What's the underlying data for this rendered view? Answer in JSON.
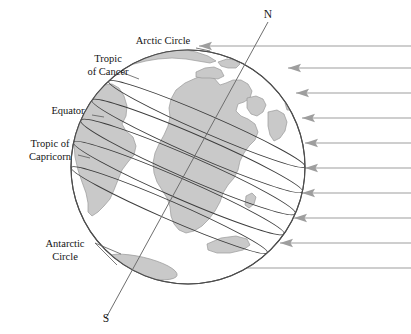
{
  "figure": {
    "background_color": "#ffffff",
    "land_color": "#c9c9c9",
    "land_stroke": "#9a9a9a",
    "outline_color": "#4d4d4d",
    "latitude_line_color": "#3c3c3c",
    "axis_color": "#6e6e6e",
    "ray_color": "#9e9e9e",
    "text_color": "#141414"
  },
  "globe": {
    "center_x": 188,
    "center_y": 167,
    "radius": 117,
    "axis_tilt_degrees": 23.5
  },
  "axis": {
    "north_label": "N",
    "south_label": "S",
    "north_x": 268,
    "north_y": 22,
    "south_x": 106,
    "south_y": 318
  },
  "latitude_labels": [
    {
      "id": "arctic-circle",
      "text": "Arctic Circle",
      "line1": "Arctic Circle",
      "line2": "",
      "x": 163,
      "y": 44,
      "anchor": "middle"
    },
    {
      "id": "tropic-of-cancer",
      "text": "Tropic of Cancer",
      "line1": "Tropic",
      "line2": "of Cancer",
      "x": 108,
      "y": 62,
      "anchor": "middle"
    },
    {
      "id": "equator",
      "text": "Equator",
      "line1": "Equator",
      "line2": "",
      "x": 68,
      "y": 114,
      "anchor": "middle"
    },
    {
      "id": "tropic-of-capricorn",
      "text": "Tropic of Capricorn",
      "line1": "Tropic of",
      "line2": "Capricorn",
      "x": 50,
      "y": 147,
      "anchor": "middle"
    },
    {
      "id": "antarctic-circle",
      "text": "Antarctic Circle",
      "line1": "Antarctic",
      "line2": "Circle",
      "x": 65,
      "y": 247,
      "anchor": "middle"
    }
  ],
  "solar_rays": {
    "count": 10,
    "direction": "right-to-left",
    "label": "incoming sunlight",
    "arrows": [
      {
        "y": 46,
        "tip_x": 199
      },
      {
        "y": 68,
        "tip_x": 288
      },
      {
        "y": 93,
        "tip_x": 296
      },
      {
        "y": 118,
        "tip_x": 302
      },
      {
        "y": 143,
        "tip_x": 305
      },
      {
        "y": 168,
        "tip_x": 305
      },
      {
        "y": 193,
        "tip_x": 302
      },
      {
        "y": 218,
        "tip_x": 294
      },
      {
        "y": 243,
        "tip_x": 280
      },
      {
        "y": 268,
        "tip_x": 190
      }
    ],
    "start_x": 411
  },
  "chart_data": {
    "type": "diagram",
    "annotations": [
      "Arctic Circle",
      "Tropic of Cancer",
      "Equator",
      "Tropic of Capricorn",
      "Antarctic Circle",
      "N",
      "S"
    ],
    "latitude_circles_degrees": [
      66.5,
      23.5,
      0,
      -23.5,
      -66.5
    ],
    "axial_tilt_degrees": 23.5,
    "ray_count": 10,
    "legend": []
  }
}
